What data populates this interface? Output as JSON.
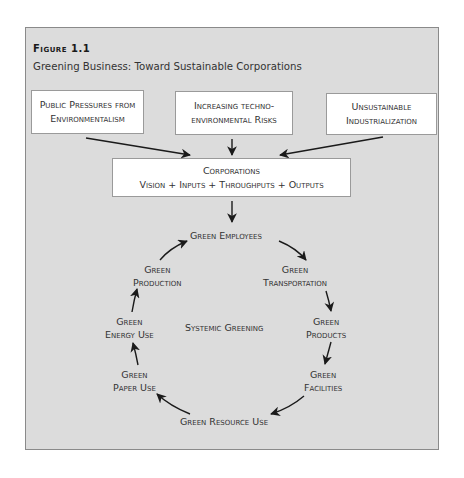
{
  "figure": {
    "label": "Figure 1.1",
    "title": "Greening Business: Toward Sustainable Corporations"
  },
  "pressures": [
    {
      "line1": "Public Pressures from",
      "line2": "Environmentalism"
    },
    {
      "line1": "Increasing techno-",
      "line2": "environmental Risks"
    },
    {
      "line1": "Unsustainable",
      "line2": "Industrialization"
    }
  ],
  "corporations": {
    "line1": "Corporations",
    "line2": "Vision + Inputs + Throughputs + Outputs"
  },
  "cycle": {
    "center_label": "Systemic Greening",
    "nodes": [
      {
        "line1": "Green Employees",
        "line2": ""
      },
      {
        "line1": "Green",
        "line2": "Transportation"
      },
      {
        "line1": "Green",
        "line2": "Products"
      },
      {
        "line1": "Green",
        "line2": "Facilities"
      },
      {
        "line1": "Green Resource Use",
        "line2": ""
      },
      {
        "line1": "Green",
        "line2": "Paper Use"
      },
      {
        "line1": "Green",
        "line2": "Energy Use"
      },
      {
        "line1": "Green",
        "line2": "Production"
      }
    ]
  },
  "colors": {
    "frame_bg": "#dcdcdc",
    "frame_border": "#8a8a8a",
    "box_bg": "#ffffff",
    "text": "#333333",
    "arrow": "#1a1a1a"
  }
}
